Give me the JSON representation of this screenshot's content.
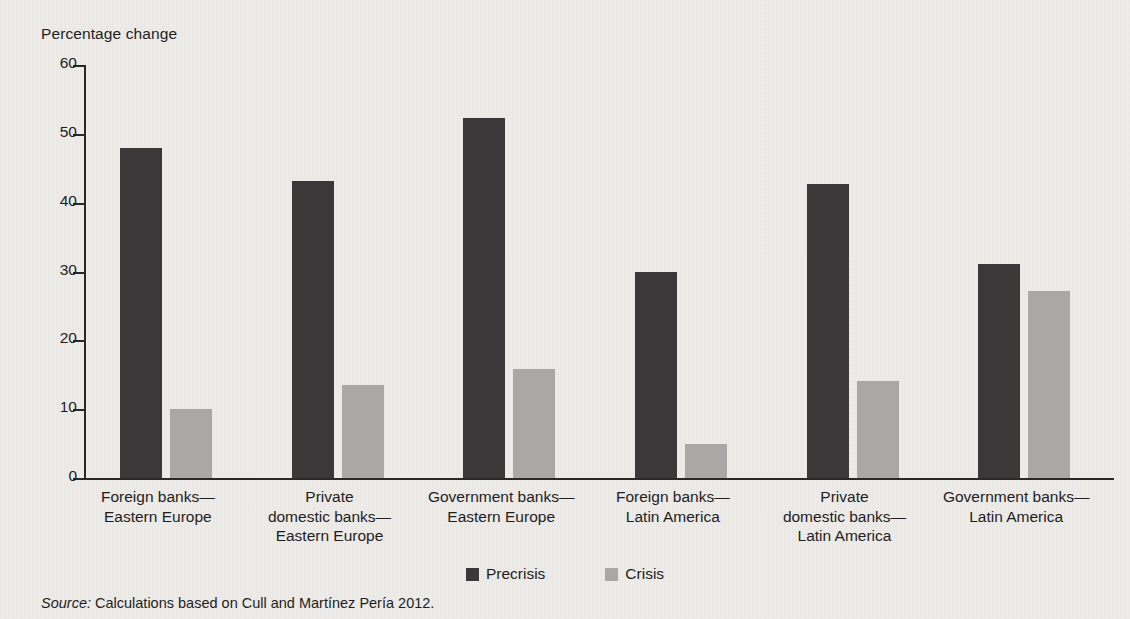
{
  "axis": {
    "ylabel": "Percentage change",
    "yticks": [
      "60",
      "50",
      "40",
      "30",
      "20",
      "10",
      "0"
    ]
  },
  "legend": {
    "items": [
      {
        "label": "Precrisis",
        "color": "#3a3839"
      },
      {
        "label": "Crisis",
        "color": "#a9a8a6"
      }
    ]
  },
  "source": {
    "prefix": "Source:",
    "text": " Calculations based on Cull and Martínez Pería 2012."
  },
  "categories": [
    {
      "line1": "Foreign banks—",
      "line2": "Eastern Europe",
      "line3": ""
    },
    {
      "line1": "Private",
      "line2": "domestic banks—",
      "line3": "Eastern Europe"
    },
    {
      "line1": "Government banks—",
      "line2": "Eastern Europe",
      "line3": ""
    },
    {
      "line1": "Foreign banks—",
      "line2": "Latin America",
      "line3": ""
    },
    {
      "line1": "Private",
      "line2": "domestic banks—",
      "line3": "Latin America"
    },
    {
      "line1": "Government banks—",
      "line2": "Latin America",
      "line3": ""
    }
  ],
  "chart_data": {
    "type": "bar",
    "title": "",
    "xlabel": "",
    "ylabel": "Percentage change",
    "ylim": [
      0,
      60
    ],
    "ytick_step": 10,
    "grid": false,
    "legend_position": "bottom-center",
    "categories": [
      "Foreign banks—Eastern Europe",
      "Private domestic banks—Eastern Europe",
      "Government banks—Eastern Europe",
      "Foreign banks—Latin America",
      "Private domestic banks—Latin America",
      "Government banks—Latin America"
    ],
    "series": [
      {
        "name": "Precrisis",
        "color": "#3a3839",
        "values": [
          48.0,
          43.2,
          52.3,
          30.0,
          42.7,
          31.1
        ]
      },
      {
        "name": "Crisis",
        "color": "#a9a8a6",
        "values": [
          10.0,
          13.5,
          15.8,
          4.9,
          14.1,
          27.2
        ]
      }
    ]
  }
}
